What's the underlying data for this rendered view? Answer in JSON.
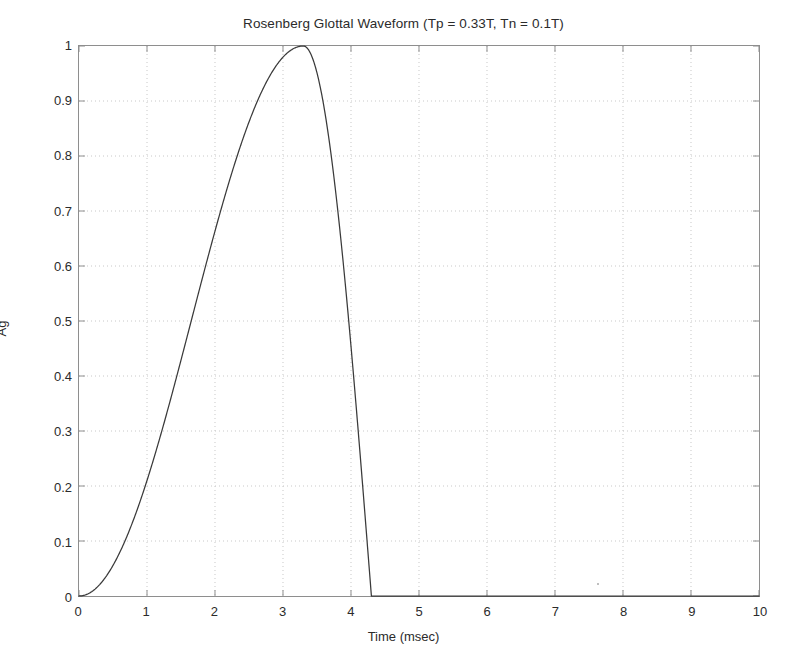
{
  "figure": {
    "width": 807,
    "height": 670,
    "background": "#ffffff",
    "axes_color": "#8e8e8e",
    "grid_color": "#c8c8c8",
    "curve_color": "#3a3a3a",
    "text_color": "#2b2b2b"
  },
  "chart_data": {
    "type": "line",
    "title": "Rosenberg Glottal Waveform (Tp = 0.33T, Tn = 0.1T)",
    "xlabel": "Time (msec)",
    "ylabel": "Ag",
    "xlim": [
      0,
      10
    ],
    "ylim": [
      0,
      1
    ],
    "grid": true,
    "grid_style": "dotted",
    "legend": null,
    "legend_position": "none",
    "xticks": [
      0,
      1,
      2,
      3,
      4,
      5,
      6,
      7,
      8,
      9,
      10
    ],
    "xtick_labels": [
      "0",
      "1",
      "2",
      "3",
      "4",
      "5",
      "6",
      "7",
      "8",
      "9",
      "10"
    ],
    "yticks": [
      0,
      0.1,
      0.2,
      0.3,
      0.4,
      0.5,
      0.6,
      0.7,
      0.8,
      0.9,
      1
    ],
    "ytick_labels": [
      "0",
      "0.1",
      "0.2",
      "0.3",
      "0.4",
      "0.5",
      "0.6",
      "0.7",
      "0.8",
      "0.9",
      "1"
    ],
    "parameters": {
      "period_T_msec": 10,
      "Tp_fraction": 0.33,
      "Tn_fraction": 0.1,
      "Tp_msec": 3.3,
      "Tn_msec": 1.0,
      "closure_time_msec": 4.3,
      "peak_amplitude": 1
    },
    "series": [
      {
        "name": "Ag(t)",
        "color": "#3a3a3a",
        "x": [
          0,
          0.1,
          0.2,
          0.3,
          0.4,
          0.5,
          0.6,
          0.7,
          0.8,
          0.9,
          1.0,
          1.1,
          1.2,
          1.3,
          1.4,
          1.5,
          1.6,
          1.7,
          1.8,
          1.9,
          2.0,
          2.1,
          2.2,
          2.3,
          2.4,
          2.5,
          2.6,
          2.7,
          2.8,
          2.9,
          3.0,
          3.1,
          3.2,
          3.3,
          3.4,
          3.5,
          3.6,
          3.7,
          3.8,
          3.9,
          4.0,
          4.1,
          4.2,
          4.3,
          4.5,
          5.0,
          5.5,
          6.0,
          6.5,
          7.0,
          7.5,
          8.0,
          8.5,
          9.0,
          9.5,
          10.0
        ],
        "y": [
          0,
          0.002,
          0.009,
          0.02,
          0.036,
          0.056,
          0.079,
          0.107,
          0.138,
          0.172,
          0.208,
          0.247,
          0.288,
          0.33,
          0.374,
          0.418,
          0.463,
          0.508,
          0.553,
          0.597,
          0.64,
          0.682,
          0.722,
          0.759,
          0.795,
          0.827,
          0.857,
          0.883,
          0.906,
          0.926,
          0.946,
          0.967,
          0.988,
          1.0,
          0.997,
          0.969,
          0.924,
          0.86,
          0.782,
          0.69,
          0.588,
          0.476,
          0.357,
          0.0,
          0,
          0,
          0,
          0,
          0,
          0,
          0,
          0,
          0,
          0,
          0,
          0
        ]
      }
    ],
    "annotations": [
      {
        "name": "scan-speck",
        "x": 7.6,
        "y": 0.025,
        "kind": "artifact"
      }
    ]
  }
}
